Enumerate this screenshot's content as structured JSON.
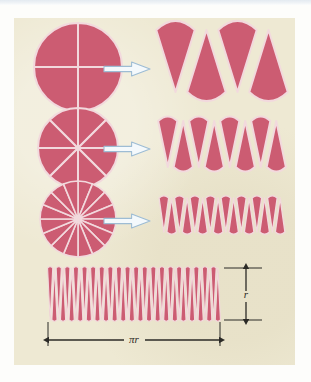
{
  "figure": {
    "panel_background": "#eee9d3",
    "page_background": "#ffffff",
    "sector_color": "#cc5c72",
    "sector_edge_color": "#f2d9dd",
    "arrow_fill": "#f4f9fc",
    "arrow_stroke": "#9dbcd4",
    "dimension_line_color": "#2b2a26"
  },
  "rows": [
    {
      "name": "row-4-sectors",
      "sector_count": 4,
      "circle": {
        "cx": 78,
        "cy": 67,
        "r": 44
      },
      "arrow": {
        "x": 104,
        "y": 62,
        "w": 46,
        "h": 14
      },
      "strip": {
        "x": 160,
        "y": 30,
        "w": 124,
        "h": 62
      }
    },
    {
      "name": "row-8-sectors",
      "sector_count": 8,
      "circle": {
        "cx": 78,
        "cy": 148,
        "r": 40
      },
      "arrow": {
        "x": 104,
        "y": 142,
        "w": 46,
        "h": 14
      },
      "strip": {
        "x": 160,
        "y": 121,
        "w": 124,
        "h": 46
      }
    },
    {
      "name": "row-16-sectors",
      "sector_count": 16,
      "circle": {
        "cx": 78,
        "cy": 219,
        "r": 38
      },
      "arrow": {
        "x": 104,
        "y": 214,
        "w": 46,
        "h": 14
      },
      "strip": {
        "x": 160,
        "y": 198,
        "w": 124,
        "h": 34
      }
    }
  ],
  "bottom": {
    "name": "row-many-sectors",
    "sector_count": 40,
    "strip": {
      "x": 48,
      "y": 268,
      "w": 172,
      "h": 52
    },
    "labels": {
      "width_label": "πr",
      "height_label": "r"
    }
  }
}
